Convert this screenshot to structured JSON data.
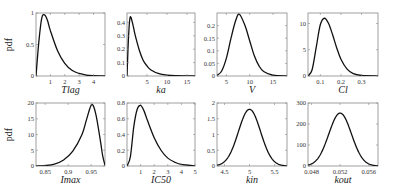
{
  "figure": {
    "ylabel": "pdf"
  },
  "chart_data": [
    {
      "type": "line",
      "title": "",
      "xlabel": "Tlag",
      "ylabel": "pdf",
      "xlim": [
        0,
        4.8
      ],
      "ylim": [
        0,
        1
      ],
      "xticks": [
        1,
        2,
        3,
        4
      ],
      "yticks": [
        0,
        0.5,
        1
      ],
      "dist": {
        "kind": "lognormal",
        "mode": 0.6,
        "peak": 0.97
      },
      "x": [
        0,
        0.2,
        0.4,
        0.6,
        0.8,
        1.0,
        1.5,
        2.0,
        2.5,
        3.0,
        3.5,
        4.0,
        4.8
      ],
      "values": [
        0,
        0.55,
        0.92,
        0.97,
        0.88,
        0.72,
        0.4,
        0.2,
        0.09,
        0.04,
        0.015,
        0.006,
        0.001
      ]
    },
    {
      "type": "line",
      "title": "",
      "xlabel": "ka",
      "ylabel": "",
      "xlim": [
        0,
        17
      ],
      "ylim": [
        0,
        0.47
      ],
      "xticks": [
        5,
        10,
        15
      ],
      "yticks": [
        0,
        0.1,
        0.2,
        0.3,
        0.4
      ],
      "dist": {
        "kind": "lognormal",
        "mode": 0.8,
        "peak": 0.44
      },
      "x": [
        0,
        0.4,
        0.8,
        1.5,
        2,
        3,
        4,
        5,
        6,
        8,
        10,
        12,
        17
      ],
      "values": [
        0,
        0.3,
        0.44,
        0.38,
        0.31,
        0.2,
        0.12,
        0.075,
        0.045,
        0.017,
        0.007,
        0.003,
        0.0
      ]
    },
    {
      "type": "line",
      "title": "",
      "xlabel": "V",
      "ylabel": "",
      "xlim": [
        3,
        18
      ],
      "ylim": [
        0,
        0.25
      ],
      "xticks": [
        5,
        10,
        15
      ],
      "yticks": [
        0,
        0.05,
        0.1,
        0.15,
        0.2
      ],
      "dist": {
        "kind": "lognormal",
        "mode": 7.8,
        "peak": 0.245
      },
      "x": [
        3,
        4,
        5,
        6,
        7,
        7.8,
        9,
        10,
        11,
        12,
        13,
        15,
        18
      ],
      "values": [
        0.002,
        0.02,
        0.07,
        0.15,
        0.22,
        0.245,
        0.2,
        0.14,
        0.08,
        0.04,
        0.018,
        0.003,
        0.0
      ]
    },
    {
      "type": "line",
      "title": "",
      "xlabel": "Cl",
      "ylabel": "",
      "xlim": [
        0.04,
        0.38
      ],
      "ylim": [
        0,
        12
      ],
      "xticks": [
        0.1,
        0.2,
        0.3
      ],
      "yticks": [
        0,
        5,
        10
      ],
      "dist": {
        "kind": "lognormal",
        "mode": 0.12,
        "peak": 11
      },
      "x": [
        0.04,
        0.06,
        0.08,
        0.1,
        0.12,
        0.14,
        0.16,
        0.18,
        0.2,
        0.23,
        0.26,
        0.3,
        0.38
      ],
      "values": [
        0,
        1.2,
        5.5,
        9.8,
        11,
        10,
        7.8,
        5.3,
        3.2,
        1.3,
        0.45,
        0.1,
        0.0
      ]
    },
    {
      "type": "line",
      "title": "",
      "xlabel": "Imax",
      "ylabel": "pdf",
      "xlim": [
        0.83,
        0.98
      ],
      "ylim": [
        0,
        20
      ],
      "xticks": [
        0.85,
        0.9,
        0.95
      ],
      "yticks": [
        0,
        5,
        10,
        15,
        20
      ],
      "dist": {
        "kind": "logit-normal",
        "mode": 0.951,
        "peak": 19.5
      },
      "x": [
        0.83,
        0.85,
        0.87,
        0.89,
        0.91,
        0.93,
        0.94,
        0.951,
        0.96,
        0.97,
        0.975,
        0.98
      ],
      "values": [
        0.02,
        0.15,
        0.6,
        1.9,
        4.7,
        10,
        14.8,
        19.5,
        16.5,
        8,
        3.2,
        0.2
      ]
    },
    {
      "type": "line",
      "title": "",
      "xlabel": "IC50",
      "ylabel": "",
      "xlim": [
        0,
        5
      ],
      "ylim": [
        0,
        0.8
      ],
      "xticks": [
        1,
        2,
        3,
        4,
        5
      ],
      "yticks": [
        0,
        0.2,
        0.4,
        0.6,
        0.8
      ],
      "dist": {
        "kind": "lognormal",
        "mode": 1.0,
        "peak": 0.77
      },
      "x": [
        0,
        0.25,
        0.5,
        0.75,
        1.0,
        1.25,
        1.5,
        2.0,
        2.5,
        3.0,
        3.5,
        4.0,
        5.0
      ],
      "values": [
        0,
        0.12,
        0.5,
        0.72,
        0.77,
        0.7,
        0.58,
        0.36,
        0.2,
        0.1,
        0.05,
        0.02,
        0.003
      ]
    },
    {
      "type": "line",
      "title": "",
      "xlabel": "kin",
      "ylabel": "",
      "xlim": [
        4.35,
        5.75
      ],
      "ylim": [
        0,
        2
      ],
      "xticks": [
        4.5,
        5,
        5.5
      ],
      "yticks": [
        0,
        0.5,
        1,
        1.5,
        2
      ],
      "dist": {
        "kind": "normal",
        "mean": 5.0,
        "peak": 1.8
      },
      "x": [
        4.35,
        4.5,
        4.6,
        4.7,
        4.8,
        4.9,
        5.0,
        5.1,
        5.2,
        5.3,
        5.4,
        5.5,
        5.65,
        5.75
      ],
      "values": [
        0.03,
        0.15,
        0.35,
        0.7,
        1.15,
        1.6,
        1.8,
        1.6,
        1.15,
        0.7,
        0.35,
        0.15,
        0.03,
        0.01
      ]
    },
    {
      "type": "line",
      "title": "",
      "xlabel": "kout",
      "ylabel": "",
      "xlim": [
        0.0475,
        0.0573
      ],
      "ylim": [
        0,
        300
      ],
      "xticks": [
        0.048,
        0.052,
        0.056
      ],
      "yticks": [
        0,
        100,
        200,
        300
      ],
      "dist": {
        "kind": "normal",
        "mean": 0.052,
        "peak": 252
      },
      "x": [
        0.0475,
        0.0485,
        0.049,
        0.05,
        0.051,
        0.052,
        0.053,
        0.054,
        0.055,
        0.0555,
        0.0565,
        0.0573
      ],
      "values": [
        2,
        12,
        28,
        90,
        185,
        252,
        185,
        90,
        28,
        14,
        2,
        0.3
      ]
    }
  ]
}
